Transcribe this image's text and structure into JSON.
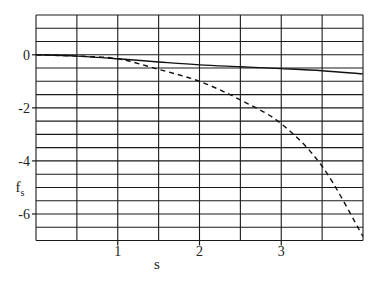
{
  "chart_data": {
    "type": "line",
    "title": "",
    "xlabel": "s",
    "ylabel": "f",
    "ylabel_subscript": "s",
    "xlim": [
      0,
      4
    ],
    "ylim": [
      -7,
      1.5
    ],
    "grid": true,
    "grid_x_step": 0.5,
    "grid_y_step": 0.5,
    "x_ticks": [
      1,
      2,
      3
    ],
    "x_tick_labels": [
      "1",
      "2",
      "3"
    ],
    "y_ticks": [
      0,
      -2,
      -4,
      -6
    ],
    "y_tick_labels": [
      "0",
      "-2",
      "-4",
      "-6"
    ],
    "legend": null,
    "x": [
      0,
      0.5,
      1,
      1.5,
      2,
      2.5,
      3,
      3.5,
      4
    ],
    "series": [
      {
        "name": "solid",
        "style": "solid",
        "values": [
          0,
          -0.05,
          -0.15,
          -0.27,
          -0.38,
          -0.45,
          -0.52,
          -0.6,
          -0.72
        ]
      },
      {
        "name": "dashed",
        "style": "dashed",
        "values": [
          0,
          -0.05,
          -0.15,
          -0.55,
          -1.0,
          -1.7,
          -2.6,
          -4.2,
          -6.85
        ]
      }
    ]
  }
}
